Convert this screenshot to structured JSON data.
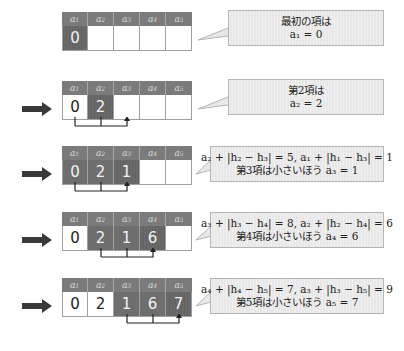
{
  "headers": [
    "a",
    "a",
    "a",
    "a",
    "a"
  ],
  "header_subscripts": [
    "1",
    "2",
    "3",
    "4",
    "5"
  ],
  "steps": [
    {
      "show_arrow": false,
      "values": [
        "0",
        "",
        "",
        "",
        ""
      ],
      "states": [
        "target",
        "empty",
        "empty",
        "empty",
        "empty"
      ],
      "bracket": null,
      "bubble": {
        "line1": "最初の項は",
        "line2": "a₁ = 0"
      }
    },
    {
      "show_arrow": true,
      "values": [
        "0",
        "2",
        "",
        "",
        ""
      ],
      "states": [
        "plain",
        "target",
        "empty",
        "empty",
        "empty"
      ],
      "bracket": {
        "from": [
          0,
          1
        ],
        "to": 2
      },
      "bubble": {
        "line1": "第2項は",
        "line2": "a₂ = 2"
      }
    },
    {
      "show_arrow": true,
      "values": [
        "0",
        "2",
        "1",
        "",
        ""
      ],
      "states": [
        "active",
        "active",
        "target",
        "empty",
        "empty"
      ],
      "bracket": {
        "from": [
          0,
          1
        ],
        "to": 2
      },
      "bubble": {
        "line1": "a₂ + |h₂ − h₃| = 5, a₁ + |h₁ − h₃| = 1",
        "line2": "第3項は小さいほう a₃ = 1"
      }
    },
    {
      "show_arrow": true,
      "values": [
        "0",
        "2",
        "1",
        "6",
        ""
      ],
      "states": [
        "plain",
        "active",
        "active",
        "target",
        "empty"
      ],
      "bracket": {
        "from": [
          1,
          2
        ],
        "to": 3
      },
      "bubble": {
        "line1": "a₃ + |h₃ − h₄| = 8, a₂ + |h₂ − h₄| = 6",
        "line2": "第4項は小さいほう a₄ = 6"
      }
    },
    {
      "show_arrow": true,
      "values": [
        "0",
        "2",
        "1",
        "6",
        "7"
      ],
      "states": [
        "plain",
        "plain",
        "active",
        "active",
        "target"
      ],
      "bracket": {
        "from": [
          2,
          3
        ],
        "to": 4
      },
      "bubble": {
        "line1": "a₄ + |h₄ − h₅| = 7, a₃ + |h₃ − h₅| = 9",
        "line2": "第5項は小さいほう a₅ = 7"
      }
    }
  ],
  "colors": {
    "header_bg": "#7b7b7b",
    "active_cell": "#6e6e6e",
    "bubble_bg": "#e8e8e8",
    "arrow": "#3a3a3a"
  }
}
